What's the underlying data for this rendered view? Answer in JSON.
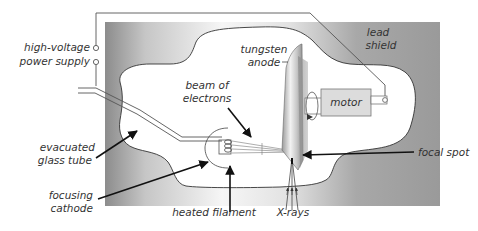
{
  "labels": {
    "high_voltage_line1": "high-voltage",
    "high_voltage_line2": "power supply",
    "lead_shield_line1": "lead",
    "lead_shield_line2": "shield",
    "tungsten_anode_line1": "tungsten",
    "tungsten_anode_line2": "anode",
    "beam_line1": "beam of",
    "beam_line2": "electrons",
    "motor": "motor",
    "evacuated_line1": "evacuated",
    "evacuated_line2": "glass tube",
    "focusing_line1": "focusing",
    "focusing_line2": "cathode",
    "heated_filament": "heated filament",
    "xrays": "X-rays",
    "focal_spot": "focal spot"
  },
  "colors": {
    "shield_dark": "#8c8c8c",
    "shield_mid": "#9c9c9c",
    "shield_light": "#f4f4f4",
    "motor_fill": "#dcdcdc",
    "anode_dark": "#8a8a8a",
    "anode_light": "#f0f0f0"
  }
}
